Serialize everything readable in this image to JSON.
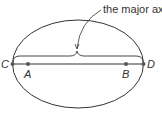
{
  "diagram": {
    "annotation": "the major axis",
    "points": {
      "C": "C",
      "A": "A",
      "B": "B",
      "D": "D"
    },
    "colors": {
      "stroke": "#333333",
      "background": "#ffffff"
    }
  }
}
